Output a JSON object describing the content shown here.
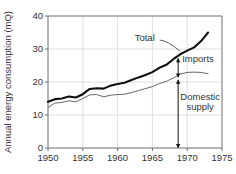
{
  "chart_data": {
    "type": "line",
    "title": "",
    "xlabel": "",
    "ylabel": "Annual energy consumption (mQ)",
    "xlim": [
      1950,
      1975
    ],
    "ylim": [
      0,
      40
    ],
    "grid": true,
    "legend": "none",
    "xticks": [
      1950,
      1955,
      1960,
      1965,
      1970,
      1975
    ],
    "yticks": [
      0,
      10,
      20,
      30,
      40
    ],
    "xtick_labels": [
      "1950",
      "1955",
      "1960",
      "1965",
      "1970",
      "1975"
    ],
    "ytick_labels": [
      "0",
      "10",
      "20",
      "30",
      "40"
    ],
    "series": [
      {
        "name": "Total",
        "style": "thick",
        "x": [
          1950,
          1951,
          1952,
          1953,
          1954,
          1955,
          1956,
          1957,
          1958,
          1959,
          1960,
          1961,
          1962,
          1963,
          1964,
          1965,
          1966,
          1967,
          1968,
          1969,
          1970,
          1971,
          1972,
          1973
        ],
        "values": [
          14.0,
          14.8,
          15.0,
          15.6,
          15.3,
          16.3,
          17.9,
          18.1,
          18.0,
          18.9,
          19.4,
          19.8,
          20.6,
          21.4,
          22.1,
          23.0,
          24.3,
          25.2,
          26.9,
          28.4,
          29.5,
          30.5,
          32.4,
          35.0
        ]
      },
      {
        "name": "Domestic supply",
        "style": "thin",
        "x": [
          1950,
          1951,
          1952,
          1953,
          1954,
          1955,
          1956,
          1957,
          1958,
          1959,
          1960,
          1961,
          1962,
          1963,
          1964,
          1965,
          1966,
          1967,
          1968,
          1969,
          1970,
          1971,
          1972,
          1973
        ],
        "values": [
          12.3,
          13.6,
          13.8,
          14.3,
          14.0,
          15.0,
          16.1,
          16.2,
          15.5,
          16.0,
          16.2,
          16.3,
          16.8,
          17.4,
          18.0,
          18.6,
          19.5,
          20.2,
          21.2,
          22.4,
          22.9,
          23.0,
          22.9,
          22.5
        ]
      }
    ],
    "annotations": [
      {
        "id": "total-label",
        "text": "Total",
        "x": 1963.9,
        "y": 32.4,
        "leader_to": {
          "x": 1969.0,
          "y": 29.3
        }
      },
      {
        "id": "imports-label",
        "text": "Imports",
        "x": 1969.6,
        "y": 26.0,
        "arrow": {
          "x": 1968.7,
          "y_top": 27.2,
          "y_bottom": 21.4
        },
        "arrow_type": "double"
      },
      {
        "id": "domestic-supply-label",
        "line1": "Domestic",
        "line2": "supply",
        "x": 1969.6,
        "y": 14.4,
        "arrow": {
          "x": 1968.7,
          "y_top": 20.7,
          "y_bottom": 0.0
        },
        "arrow_type": "down"
      }
    ]
  },
  "colors": {
    "total_line": "#111111",
    "domestic_line": "#555555",
    "grid": "#d8d8d8",
    "axis": "#6e6e6e",
    "text": "#333333",
    "background": "#ffffff"
  }
}
